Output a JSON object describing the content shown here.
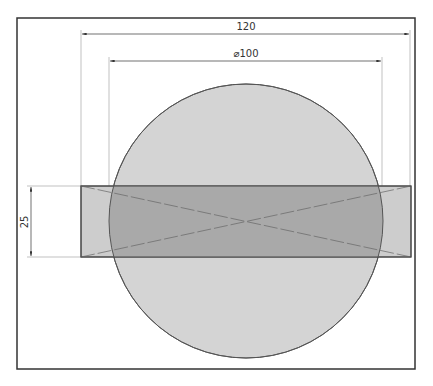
{
  "drawing": {
    "frame": {
      "x": 17,
      "y": 18,
      "w": 398,
      "h": 351,
      "stroke": "#333333"
    },
    "circle": {
      "cx": 246,
      "cy": 221,
      "r": 137,
      "fill": "#d4d4d4",
      "stroke": "#555555"
    },
    "rectangle": {
      "x": 81,
      "y": 186,
      "w": 330,
      "h": 71,
      "fill": "#cccccc",
      "overlap_fill": "#a9a9a9",
      "stroke": "#444444"
    },
    "dimensions": {
      "width_overall": {
        "label": "120",
        "y": 34,
        "x1": 81,
        "x2": 410
      },
      "diameter": {
        "label": "⌀100",
        "y": 61,
        "x1": 109,
        "x2": 382
      },
      "height": {
        "label": "25",
        "x": 31,
        "y1": 186,
        "y2": 257
      }
    }
  }
}
